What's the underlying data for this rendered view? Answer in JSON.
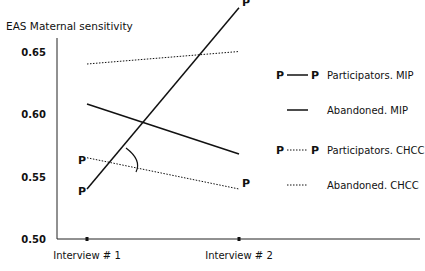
{
  "chart_data": {
    "type": "line",
    "title": "",
    "ylabel": "EAS Maternal sensitivity",
    "xlabel": "",
    "categories": [
      "Interview # 1",
      "Interview # 2"
    ],
    "ylim": [
      0.5,
      0.68
    ],
    "yticks": [
      "0.50",
      "0.55",
      "0.60",
      "0.65"
    ],
    "grid": false,
    "legend_position": "right",
    "series": [
      {
        "name": "Participators. MIP",
        "values": [
          0.54,
          0.685
        ],
        "style": "solid",
        "marker": "P"
      },
      {
        "name": "Abandoned. MIP",
        "values": [
          0.608,
          0.568
        ],
        "style": "solid",
        "marker": ""
      },
      {
        "name": "Participators. CHCC",
        "values": [
          0.565,
          0.54
        ],
        "style": "dotted",
        "marker": "P"
      },
      {
        "name": "Abandoned. CHCC",
        "values": [
          0.64,
          0.65
        ],
        "style": "dotted",
        "marker": ""
      }
    ],
    "annotations": [
      "angle arc between Participators. MIP and Participators. CHCC lines near intersection"
    ]
  },
  "legend": {
    "items": [
      {
        "label": "Participators. MIP",
        "marker": "P",
        "style": "solid"
      },
      {
        "label": "Abandoned. MIP",
        "marker": "",
        "style": "solid"
      },
      {
        "label": "Participators. CHCC",
        "marker": "P",
        "style": "dotted"
      },
      {
        "label": "Abandoned. CHCC",
        "marker": "",
        "style": "dotted"
      }
    ]
  },
  "colors": {
    "line": "#111111",
    "background": "#ffffff"
  }
}
